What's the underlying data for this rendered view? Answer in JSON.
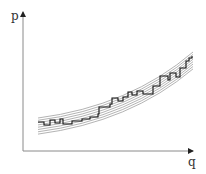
{
  "chart_data": {
    "type": "line",
    "title": "",
    "xlabel": "q",
    "ylabel": "p",
    "grid": false,
    "legend": null,
    "band_curves": {
      "count": 8,
      "color": "#a0a0a0",
      "x_range": [
        38,
        193
      ]
    },
    "step_function": {
      "color": "#111111",
      "points": [
        [
          38,
          122
        ],
        [
          44,
          122
        ],
        [
          44,
          125
        ],
        [
          50,
          125
        ],
        [
          50,
          120
        ],
        [
          55,
          120
        ],
        [
          55,
          123
        ],
        [
          60,
          123
        ],
        [
          60,
          119
        ],
        [
          63,
          119
        ],
        [
          63,
          124
        ],
        [
          72,
          124
        ],
        [
          72,
          121
        ],
        [
          82,
          121
        ],
        [
          82,
          119
        ],
        [
          90,
          119
        ],
        [
          90,
          117
        ],
        [
          98,
          117
        ],
        [
          98,
          114
        ],
        [
          99,
          114
        ],
        [
          99,
          107
        ],
        [
          110,
          107
        ],
        [
          110,
          104
        ],
        [
          112,
          104
        ],
        [
          112,
          98
        ],
        [
          118,
          98
        ],
        [
          118,
          101
        ],
        [
          123,
          101
        ],
        [
          123,
          97
        ],
        [
          128,
          97
        ],
        [
          128,
          92
        ],
        [
          132,
          92
        ],
        [
          132,
          95
        ],
        [
          137,
          95
        ],
        [
          137,
          91
        ],
        [
          143,
          91
        ],
        [
          143,
          94
        ],
        [
          153,
          94
        ],
        [
          153,
          86
        ],
        [
          160,
          86
        ],
        [
          160,
          76
        ],
        [
          168,
          76
        ],
        [
          168,
          80
        ],
        [
          170,
          80
        ],
        [
          170,
          73
        ],
        [
          176,
          73
        ],
        [
          176,
          77
        ],
        [
          180,
          77
        ],
        [
          180,
          68
        ],
        [
          186,
          68
        ],
        [
          186,
          61
        ],
        [
          189,
          61
        ],
        [
          189,
          58
        ],
        [
          192,
          58
        ],
        [
          192,
          56
        ]
      ]
    }
  },
  "axes": {
    "x_label": "q",
    "y_label": "p",
    "color": "#8a8a8a"
  }
}
